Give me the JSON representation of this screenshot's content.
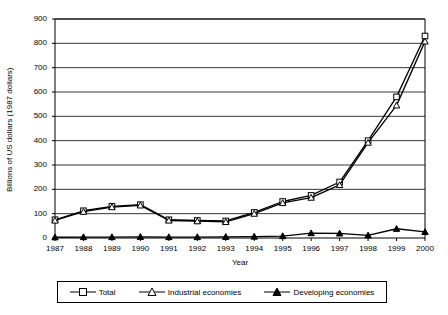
{
  "chart_data": {
    "type": "line",
    "title": "",
    "xlabel": "Year",
    "ylabel": "Billions of US dollars (1987 dollars)",
    "categories": [
      "1987",
      "1988",
      "1989",
      "1990",
      "1991",
      "1992",
      "1993",
      "1994",
      "1995",
      "1996",
      "1997",
      "1998",
      "1999",
      "2000"
    ],
    "yticks": [
      0,
      100,
      200,
      300,
      400,
      500,
      600,
      700,
      800,
      900
    ],
    "ylim": [
      0,
      900
    ],
    "grid": "horizontal",
    "legend_position": "bottom",
    "series": [
      {
        "name": "Total",
        "marker": "open-square",
        "color": "#000000",
        "values": [
          75,
          112,
          130,
          137,
          75,
          72,
          70,
          105,
          150,
          175,
          230,
          400,
          580,
          830
        ]
      },
      {
        "name": "Industrial economies",
        "marker": "open-triangle",
        "color": "#000000",
        "values": [
          72,
          108,
          127,
          134,
          72,
          69,
          66,
          100,
          144,
          166,
          218,
          392,
          545,
          808
        ]
      },
      {
        "name": "Developing economies",
        "marker": "filled-triangle",
        "color": "#000000",
        "values": [
          3,
          4,
          4,
          5,
          4,
          4,
          5,
          6,
          8,
          20,
          19,
          11,
          38,
          25
        ]
      }
    ]
  },
  "legend": {
    "items": [
      {
        "label": "Total"
      },
      {
        "label": "Industrial economies"
      },
      {
        "label": "Developing economies"
      }
    ]
  }
}
